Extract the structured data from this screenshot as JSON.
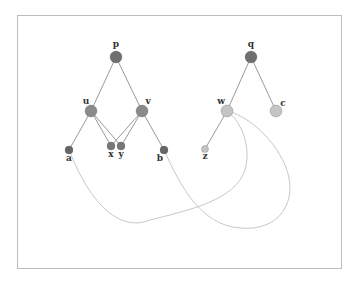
{
  "diagram": {
    "type": "two rooted trees with cross curves",
    "frame": {
      "x": 17,
      "y": 15,
      "width": 324,
      "height": 253
    },
    "colors": {
      "root": "#6f6f6f",
      "internal_left": "#8a8a8a",
      "leaf_left": "#666666",
      "light_node": "#c4c4c4",
      "edge": "#9a9a9a",
      "curve": "#c8c8c8"
    },
    "nodes": [
      {
        "id": "p",
        "label": "p",
        "x": 116,
        "y": 57,
        "r": 6,
        "fill": "#6f6f6f",
        "lx": 116,
        "ly": 47
      },
      {
        "id": "u",
        "label": "u",
        "x": 91,
        "y": 111,
        "r": 6,
        "fill": "#8a8a8a",
        "lx": 86,
        "ly": 104
      },
      {
        "id": "v",
        "label": "v",
        "x": 142,
        "y": 111,
        "r": 6,
        "fill": "#8a8a8a",
        "lx": 148,
        "ly": 104
      },
      {
        "id": "a",
        "label": "a",
        "x": 69,
        "y": 150,
        "r": 4,
        "fill": "#666666",
        "lx": 69,
        "ly": 161
      },
      {
        "id": "x",
        "label": "x",
        "x": 111,
        "y": 146,
        "r": 4,
        "fill": "#777777",
        "lx": 111,
        "ly": 157
      },
      {
        "id": "y",
        "label": "y",
        "x": 121,
        "y": 146,
        "r": 4,
        "fill": "#777777",
        "lx": 121,
        "ly": 157
      },
      {
        "id": "b",
        "label": "b",
        "x": 164,
        "y": 150,
        "r": 4,
        "fill": "#666666",
        "lx": 160,
        "ly": 161
      },
      {
        "id": "q",
        "label": "q",
        "x": 251,
        "y": 57,
        "r": 6,
        "fill": "#6f6f6f",
        "lx": 251,
        "ly": 47
      },
      {
        "id": "w",
        "label": "w",
        "x": 227,
        "y": 111,
        "r": 6,
        "fill": "#c4c4c4",
        "lx": 221,
        "ly": 104
      },
      {
        "id": "c",
        "label": "c",
        "x": 276,
        "y": 111,
        "r": 6,
        "fill": "#c4c4c4",
        "lx": 283,
        "ly": 106
      },
      {
        "id": "z",
        "label": "z",
        "x": 205,
        "y": 149,
        "r": 3.5,
        "fill": "#c4c4c4",
        "lx": 205,
        "ly": 159
      }
    ],
    "edges": [
      {
        "from": "p",
        "to": "u"
      },
      {
        "from": "p",
        "to": "v"
      },
      {
        "from": "u",
        "to": "a"
      },
      {
        "from": "u",
        "to": "x"
      },
      {
        "from": "u",
        "to": "y"
      },
      {
        "from": "v",
        "to": "x"
      },
      {
        "from": "v",
        "to": "y"
      },
      {
        "from": "v",
        "to": "b"
      },
      {
        "from": "q",
        "to": "w"
      },
      {
        "from": "q",
        "to": "c"
      },
      {
        "from": "w",
        "to": "z"
      }
    ],
    "curves": [
      {
        "from": "a",
        "to": "w",
        "path": "M69,150 C95,215 125,230 150,220 C190,210 235,200 245,170 C252,145 240,120 227,111"
      },
      {
        "from": "b",
        "to": "w",
        "path": "M164,150 C180,185 200,225 240,228 C280,232 300,200 285,165 C272,135 245,115 227,111"
      }
    ]
  }
}
